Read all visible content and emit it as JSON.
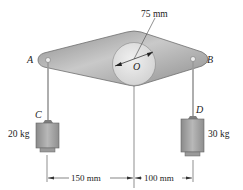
{
  "diagram": {
    "points": {
      "A": "A",
      "B": "B",
      "C": "C",
      "D": "D",
      "O": "O"
    },
    "radius_label": "75 mm",
    "masses": {
      "C": "20 kg",
      "D": "30 kg"
    },
    "dimensions": {
      "left": "150 mm",
      "right": "100 mm"
    },
    "colors": {
      "plate": "#9a9a9a",
      "plate_light": "#c8c8c8",
      "disk": "#d9d9d9",
      "weight": "#a8a8a8",
      "line": "#333333"
    }
  }
}
